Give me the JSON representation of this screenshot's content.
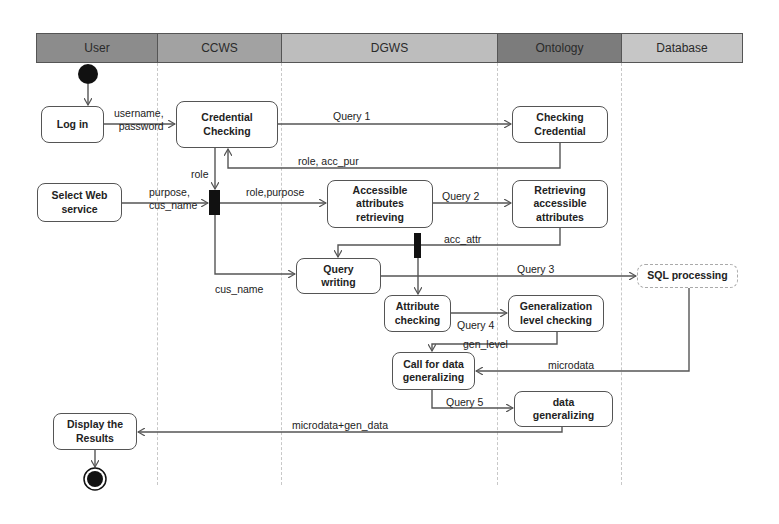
{
  "lanes": [
    {
      "label": "User",
      "color": "#8c8c8c"
    },
    {
      "label": "CCWS",
      "color": "#a2a2a2"
    },
    {
      "label": "DGWS",
      "color": "#bdbdbd"
    },
    {
      "label": "Ontology",
      "color": "#7c7c7c"
    },
    {
      "label": "Database",
      "color": "#c6c6c6"
    }
  ],
  "nodes": {
    "login": "Log in",
    "credential_checking": "Credential\nChecking",
    "checking_credential": "Checking\nCredential",
    "select_web_service": "Select Web\nservice",
    "accessible_attributes": "Accessible\nattributes\nretrieving",
    "retrieving_attributes": "Retrieving\naccessible\nattributes",
    "query_writing": "Query\nwriting",
    "sql_processing": "SQL processing",
    "attribute_checking": "Attribute\nchecking",
    "generalization_level": "Generalization\nlevel checking",
    "call_for_data": "Call for data\ngeneralizing",
    "data_generalizing": "data\ngeneralizing",
    "display_results": "Display the\nResults"
  },
  "edge_labels": {
    "username_password": "username,\npassword",
    "query1": "Query 1",
    "role_acc_pur": "role, acc_pur",
    "role": "role",
    "purpose_cus_name": "purpose,\ncus_name",
    "role_purpose": "role,purpose",
    "query2": "Query 2",
    "acc_attr": "acc_attr",
    "cus_name": "cus_name",
    "query3": "Query 3",
    "query4": "Query 4",
    "gen_level": "gen_level",
    "microdata": "microdata",
    "query5": "Query 5",
    "microdata_gen_data": "microdata+gen_data"
  }
}
